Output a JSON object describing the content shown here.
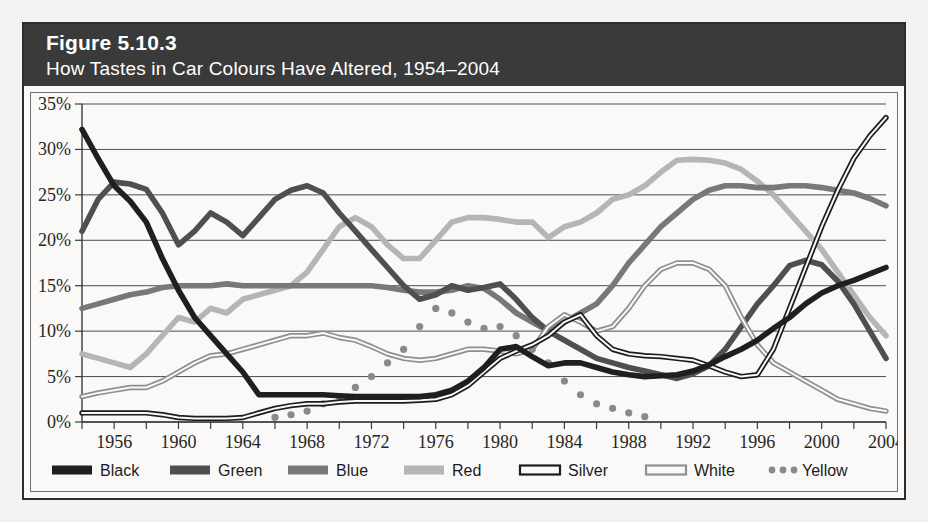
{
  "figure": {
    "number": "Figure 5.10.3",
    "subtitle": "How Tastes in Car Colours Have Altered, 1954–2004"
  },
  "chart_data": {
    "type": "line",
    "title": "How Tastes in Car Colours Have Altered, 1954–2004",
    "xlabel": "",
    "ylabel": "",
    "xlim": [
      1954,
      2004
    ],
    "ylim": [
      0,
      35
    ],
    "grid": true,
    "legend_position": "bottom",
    "y_ticks": [
      0,
      5,
      10,
      15,
      20,
      25,
      30,
      35
    ],
    "y_tick_labels": [
      "0%",
      "5%",
      "10%",
      "15%",
      "20%",
      "25%",
      "30%",
      "35%"
    ],
    "x_ticks": [
      1954,
      1956,
      1958,
      1960,
      1962,
      1964,
      1966,
      1968,
      1970,
      1972,
      1974,
      1976,
      1978,
      1980,
      1982,
      1984,
      1986,
      1988,
      1990,
      1992,
      1994,
      1996,
      1998,
      2000,
      2002,
      2004
    ],
    "x_tick_labels": [
      "1956",
      "1960",
      "1964",
      "1968",
      "1972",
      "1976",
      "1980",
      "1984",
      "1988",
      "1992",
      "1996",
      "2000",
      "2004"
    ],
    "x_labeled_ticks": [
      1956,
      1960,
      1964,
      1968,
      1972,
      1976,
      1980,
      1984,
      1988,
      1992,
      1996,
      2000,
      2004
    ],
    "x": [
      1954,
      1955,
      1956,
      1957,
      1958,
      1959,
      1960,
      1961,
      1962,
      1963,
      1964,
      1965,
      1966,
      1967,
      1968,
      1969,
      1970,
      1971,
      1972,
      1973,
      1974,
      1975,
      1976,
      1977,
      1978,
      1979,
      1980,
      1981,
      1982,
      1983,
      1984,
      1985,
      1986,
      1987,
      1988,
      1989,
      1990,
      1991,
      1992,
      1993,
      1994,
      1995,
      1996,
      1997,
      1998,
      1999,
      2000,
      2001,
      2002,
      2003,
      2004
    ],
    "series": [
      {
        "name": "Black",
        "style": "solid-thick",
        "color": "#1f1f1f",
        "values": [
          32.2,
          29.0,
          26.0,
          24.3,
          22.0,
          18.0,
          14.5,
          11.5,
          9.5,
          7.5,
          5.5,
          3.0,
          3.0,
          3.0,
          3.0,
          3.0,
          2.9,
          2.8,
          2.8,
          2.8,
          2.8,
          2.8,
          3.0,
          3.5,
          4.5,
          6.0,
          8.0,
          8.3,
          7.2,
          6.2,
          6.5,
          6.5,
          6.0,
          5.5,
          5.2,
          5.0,
          5.1,
          5.2,
          5.6,
          6.3,
          7.2,
          8.0,
          9.0,
          10.3,
          11.5,
          13.0,
          14.2,
          15.0,
          15.6,
          16.3,
          17.0
        ]
      },
      {
        "name": "Green",
        "style": "solid-thick",
        "color": "#4f4f4f",
        "values": [
          21.0,
          24.5,
          26.4,
          26.2,
          25.6,
          23.0,
          19.5,
          21.0,
          23.0,
          22.0,
          20.5,
          22.5,
          24.5,
          25.5,
          26.0,
          25.2,
          23.0,
          21.0,
          19.0,
          17.0,
          15.0,
          13.5,
          14.0,
          15.0,
          14.5,
          14.8,
          15.2,
          13.5,
          11.5,
          10.0,
          9.0,
          8.0,
          7.0,
          6.5,
          6.0,
          5.6,
          5.2,
          4.8,
          5.3,
          6.2,
          8.0,
          10.5,
          13.0,
          15.0,
          17.2,
          17.8,
          17.3,
          15.5,
          13.0,
          10.0,
          7.0
        ]
      },
      {
        "name": "Blue",
        "style": "solid-thick",
        "color": "#787878",
        "values": [
          12.5,
          13.0,
          13.5,
          14.0,
          14.3,
          14.8,
          15.0,
          15.0,
          15.0,
          15.2,
          15.0,
          15.0,
          15.0,
          15.0,
          15.0,
          15.0,
          15.0,
          15.0,
          15.0,
          14.8,
          14.5,
          14.3,
          14.3,
          14.5,
          15.0,
          14.7,
          13.5,
          12.0,
          11.0,
          10.0,
          11.0,
          12.0,
          13.0,
          15.0,
          17.5,
          19.5,
          21.5,
          23.0,
          24.5,
          25.5,
          26.0,
          26.0,
          25.8,
          25.8,
          26.0,
          26.0,
          25.8,
          25.5,
          25.2,
          24.6,
          23.8
        ]
      },
      {
        "name": "Red",
        "style": "solid-thick",
        "color": "#b5b5b5",
        "values": [
          7.5,
          7.0,
          6.5,
          6.0,
          7.5,
          9.5,
          11.5,
          11.0,
          12.5,
          12.0,
          13.5,
          14.0,
          14.5,
          15.0,
          16.5,
          19.0,
          21.5,
          22.5,
          21.5,
          19.5,
          18.0,
          18.0,
          20.0,
          22.0,
          22.5,
          22.5,
          22.3,
          22.0,
          22.0,
          20.3,
          21.5,
          22.0,
          23.0,
          24.5,
          25.0,
          26.0,
          27.5,
          28.8,
          28.9,
          28.8,
          28.5,
          27.8,
          26.5,
          25.0,
          23.0,
          21.0,
          19.0,
          16.5,
          14.0,
          11.5,
          9.5
        ]
      },
      {
        "name": "Silver",
        "style": "double-dark",
        "color": "#1c1c1c",
        "values": [
          1.0,
          1.0,
          1.0,
          1.0,
          1.0,
          0.8,
          0.5,
          0.4,
          0.4,
          0.4,
          0.5,
          1.0,
          1.5,
          1.8,
          2.0,
          2.0,
          2.2,
          2.3,
          2.3,
          2.3,
          2.3,
          2.4,
          2.5,
          3.0,
          4.0,
          5.5,
          7.0,
          7.8,
          8.5,
          9.5,
          11.0,
          11.8,
          9.5,
          8.0,
          7.5,
          7.3,
          7.2,
          7.0,
          6.8,
          6.2,
          5.5,
          5.0,
          5.2,
          8.0,
          12.5,
          17.0,
          21.5,
          25.5,
          29.0,
          31.5,
          33.5
        ]
      },
      {
        "name": "White",
        "style": "double-light",
        "color": "#8f8f8f",
        "values": [
          2.8,
          3.2,
          3.5,
          3.8,
          3.8,
          4.5,
          5.5,
          6.5,
          7.3,
          7.5,
          8.0,
          8.5,
          9.0,
          9.5,
          9.5,
          9.8,
          9.3,
          9.0,
          8.3,
          7.5,
          7.0,
          6.8,
          7.0,
          7.5,
          8.0,
          8.0,
          7.8,
          7.5,
          8.0,
          10.5,
          11.8,
          11.0,
          10.0,
          10.5,
          12.5,
          15.0,
          16.8,
          17.5,
          17.5,
          16.8,
          15.0,
          11.5,
          8.5,
          6.5,
          5.5,
          4.5,
          3.5,
          2.5,
          2.0,
          1.5,
          1.2
        ]
      },
      {
        "name": "Yellow",
        "style": "dotted",
        "color": "#8a8a8a",
        "values": [
          null,
          null,
          null,
          null,
          null,
          null,
          null,
          null,
          null,
          null,
          null,
          null,
          0.5,
          0.8,
          1.2,
          2.0,
          2.8,
          3.8,
          5.0,
          6.5,
          8.0,
          10.5,
          12.5,
          12.0,
          11.0,
          10.3,
          10.5,
          9.5,
          8.0,
          6.5,
          4.5,
          3.0,
          2.0,
          1.5,
          1.0,
          0.6,
          null,
          null,
          null,
          null,
          null,
          null,
          null,
          null,
          null,
          null,
          null,
          null,
          null,
          null,
          null
        ]
      }
    ]
  },
  "legend": {
    "items": [
      {
        "label": "Black",
        "swatch": "solid-thick",
        "color": "#1f1f1f"
      },
      {
        "label": "Green",
        "swatch": "solid-thick",
        "color": "#4f4f4f"
      },
      {
        "label": "Blue",
        "swatch": "solid-thick",
        "color": "#787878"
      },
      {
        "label": "Red",
        "swatch": "solid-thick",
        "color": "#b5b5b5"
      },
      {
        "label": "Silver",
        "swatch": "double-dark",
        "color": "#1c1c1c"
      },
      {
        "label": "White",
        "swatch": "double-light",
        "color": "#8f8f8f"
      },
      {
        "label": "Yellow",
        "swatch": "dotted",
        "color": "#8a8a8a"
      }
    ]
  }
}
